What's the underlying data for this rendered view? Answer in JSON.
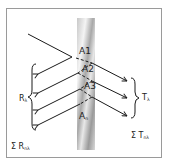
{
  "diagram": {
    "slab": {
      "color_light": "#f2f2f2",
      "color_dark": "#9c9c9c"
    },
    "interface_points": [
      {
        "label": "A1"
      },
      {
        "label": "A2"
      },
      {
        "label": "A3"
      },
      {
        "label": "A",
        "subscript": "n"
      }
    ],
    "reflected_group": {
      "label": "R",
      "subscript": "λ"
    },
    "transmitted_group": {
      "label": "T",
      "subscript": "λ"
    },
    "sum_reflected": {
      "symbol": "Σ",
      "label": "R",
      "subscript": "nλ"
    },
    "sum_transmitted": {
      "symbol": "Σ",
      "label": "T",
      "subscript": "nλ"
    },
    "colors": {
      "line": "#1a1a1a",
      "frame": "#9a9a9a"
    }
  }
}
